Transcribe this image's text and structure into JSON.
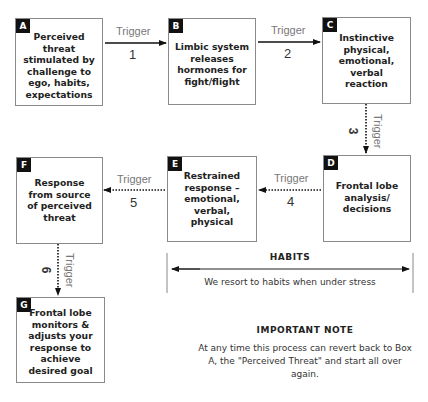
{
  "diagram": {
    "boxes": {
      "A": {
        "letter": "A",
        "text": "Perceived threat stimulated by challenge to ego, habits, expectations"
      },
      "B": {
        "letter": "B",
        "text": "Limbic system releases hormones for fight/flight"
      },
      "C": {
        "letter": "C",
        "text": "Instinctive physical, emotional, verbal reaction"
      },
      "D": {
        "letter": "D",
        "text": "Frontal lobe analysis/ decisions"
      },
      "E": {
        "letter": "E",
        "text": "Restrained response – emotional, verbal, physical"
      },
      "F": {
        "letter": "F",
        "text": "Response from source of perceived threat"
      },
      "G": {
        "letter": "G",
        "text": "Frontal lobe monitors & adjusts your response to achieve desired goal"
      }
    },
    "triggers": [
      {
        "label": "Trigger",
        "number": "1",
        "from": "A",
        "to": "B",
        "style": "solid"
      },
      {
        "label": "Trigger",
        "number": "2",
        "from": "B",
        "to": "C",
        "style": "solid"
      },
      {
        "label": "Trigger",
        "number": "3",
        "from": "C",
        "to": "D",
        "style": "dotted"
      },
      {
        "label": "Trigger",
        "number": "4",
        "from": "D",
        "to": "E",
        "style": "dotted"
      },
      {
        "label": "Trigger",
        "number": "5",
        "from": "E",
        "to": "F",
        "style": "dotted"
      },
      {
        "label": "Trigger",
        "number": "6",
        "from": "F",
        "to": "G",
        "style": "dotted"
      }
    ],
    "habits": {
      "title": "HABITS",
      "subtitle": "We resort to habits when under stress"
    },
    "note": {
      "title": "IMPORTANT NOTE",
      "text": "At any time this process can revert back to Box A, the \"Perceived Threat\" and start all over again."
    }
  }
}
